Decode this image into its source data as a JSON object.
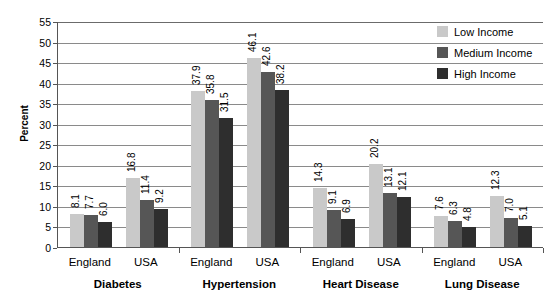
{
  "chart_data": {
    "type": "bar",
    "title": "",
    "subtitle": "",
    "xlabel": "",
    "ylabel": "Percent",
    "ylim": [
      0,
      55
    ],
    "ytick_step": 5,
    "yticks": [
      55,
      50,
      45,
      40,
      35,
      30,
      25,
      20,
      15,
      10,
      5,
      0
    ],
    "grid": true,
    "legend_position": "top-right",
    "legend": [
      "Low Income",
      "Medium Income",
      "High Income"
    ],
    "series_colors": {
      "low": "#c9c9c9",
      "medium": "#565656",
      "high": "#2e2e2e"
    },
    "groups": [
      "Diabetes",
      "Hypertension",
      "Heart Disease",
      "Lung Disease"
    ],
    "subgroups": [
      "England",
      "USA"
    ],
    "categories": [
      "Diabetes / England",
      "Diabetes / USA",
      "Hypertension / England",
      "Hypertension / USA",
      "Heart Disease / England",
      "Heart Disease / USA",
      "Lung Disease / England",
      "Lung Disease / USA"
    ],
    "series": [
      {
        "name": "Low Income",
        "values": [
          8.1,
          16.8,
          37.9,
          46.1,
          14.3,
          20.2,
          7.6,
          12.3
        ]
      },
      {
        "name": "Medium Income",
        "values": [
          7.7,
          11.4,
          35.8,
          42.6,
          9.1,
          13.1,
          6.3,
          7.0
        ]
      },
      {
        "name": "High Income",
        "values": [
          6.0,
          9.2,
          31.5,
          38.2,
          6.9,
          12.1,
          4.8,
          5.1
        ]
      }
    ],
    "bars": [
      {
        "group": "Diabetes",
        "country": "England",
        "series": "Low Income",
        "value": 8.1,
        "label": "8.1"
      },
      {
        "group": "Diabetes",
        "country": "England",
        "series": "Medium Income",
        "value": 7.7,
        "label": "7.7"
      },
      {
        "group": "Diabetes",
        "country": "England",
        "series": "High Income",
        "value": 6.0,
        "label": "6.0"
      },
      {
        "group": "Diabetes",
        "country": "USA",
        "series": "Low Income",
        "value": 16.8,
        "label": "16.8"
      },
      {
        "group": "Diabetes",
        "country": "USA",
        "series": "Medium Income",
        "value": 11.4,
        "label": "11.4"
      },
      {
        "group": "Diabetes",
        "country": "USA",
        "series": "High Income",
        "value": 9.2,
        "label": "9.2"
      },
      {
        "group": "Hypertension",
        "country": "England",
        "series": "Low Income",
        "value": 37.9,
        "label": "37.9"
      },
      {
        "group": "Hypertension",
        "country": "England",
        "series": "Medium Income",
        "value": 35.8,
        "label": "35.8"
      },
      {
        "group": "Hypertension",
        "country": "England",
        "series": "High Income",
        "value": 31.5,
        "label": "31.5"
      },
      {
        "group": "Hypertension",
        "country": "USA",
        "series": "Low Income",
        "value": 46.1,
        "label": "46.1"
      },
      {
        "group": "Hypertension",
        "country": "USA",
        "series": "Medium Income",
        "value": 42.6,
        "label": "42.6"
      },
      {
        "group": "Hypertension",
        "country": "USA",
        "series": "High Income",
        "value": 38.2,
        "label": "38.2"
      },
      {
        "group": "Heart Disease",
        "country": "England",
        "series": "Low Income",
        "value": 14.3,
        "label": "14.3"
      },
      {
        "group": "Heart Disease",
        "country": "England",
        "series": "Medium Income",
        "value": 9.1,
        "label": "9.1"
      },
      {
        "group": "Heart Disease",
        "country": "England",
        "series": "High Income",
        "value": 6.9,
        "label": "6.9"
      },
      {
        "group": "Heart Disease",
        "country": "USA",
        "series": "Low Income",
        "value": 20.2,
        "label": "20.2"
      },
      {
        "group": "Heart Disease",
        "country": "USA",
        "series": "Medium Income",
        "value": 13.1,
        "label": "13.1"
      },
      {
        "group": "Heart Disease",
        "country": "USA",
        "series": "High Income",
        "value": 12.1,
        "label": "12.1"
      },
      {
        "group": "Lung Disease",
        "country": "England",
        "series": "Low Income",
        "value": 7.6,
        "label": "7.6"
      },
      {
        "group": "Lung Disease",
        "country": "England",
        "series": "Medium Income",
        "value": 6.3,
        "label": "6.3"
      },
      {
        "group": "Lung Disease",
        "country": "England",
        "series": "High Income",
        "value": 4.8,
        "label": "4.8"
      },
      {
        "group": "Lung Disease",
        "country": "USA",
        "series": "Low Income",
        "value": 12.3,
        "label": "12.3"
      },
      {
        "group": "Lung Disease",
        "country": "USA",
        "series": "Medium Income",
        "value": 7.0,
        "label": "7.0"
      },
      {
        "group": "Lung Disease",
        "country": "USA",
        "series": "High Income",
        "value": 5.1,
        "label": "5.1"
      }
    ]
  }
}
